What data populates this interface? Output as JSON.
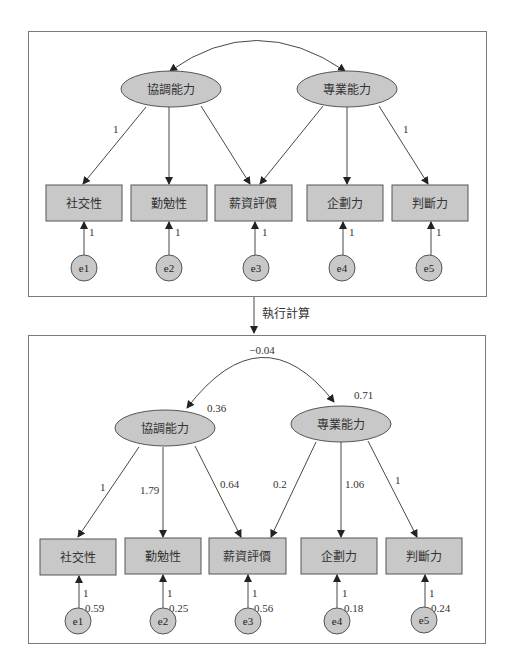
{
  "colors": {
    "node_fill": "#c8c8c8",
    "node_stroke": "#555555",
    "panel_stroke": "#7a7a7a",
    "line": "#333333"
  },
  "step_label": "執行計算",
  "top": {
    "latents": [
      {
        "id": "F1",
        "label": "協調能力"
      },
      {
        "id": "F2",
        "label": "專業能力"
      }
    ],
    "observed": [
      "社交性",
      "勤勉性",
      "薪資評價",
      "企劃力",
      "判斷力"
    ],
    "errors": [
      "e1",
      "e2",
      "e3",
      "e4",
      "e5"
    ],
    "loading_labels": {
      "F1_社交性": "1",
      "F2_判斷力": "1"
    },
    "error_paths": [
      "1",
      "1",
      "1",
      "1",
      "1"
    ]
  },
  "bottom": {
    "latents": [
      {
        "id": "F1",
        "label": "協調能力",
        "variance": "0.36"
      },
      {
        "id": "F2",
        "label": "專業能力",
        "variance": "0.71"
      }
    ],
    "covariance": "−0.04",
    "observed": [
      "社交性",
      "勤勉性",
      "薪資評價",
      "企劃力",
      "判斷力"
    ],
    "loadings": {
      "F1_社交性": "1",
      "F1_勤勉性": "1.79",
      "F1_薪資評價": "0.64",
      "F2_薪資評價": "0.2",
      "F2_企劃力": "1.06",
      "F2_判斷力": "1"
    },
    "errors": [
      {
        "label": "e1",
        "path": "1",
        "variance": "0.59"
      },
      {
        "label": "e2",
        "path": "1",
        "variance": "0.25"
      },
      {
        "label": "e3",
        "path": "1",
        "variance": "0.56"
      },
      {
        "label": "e4",
        "path": "1",
        "variance": "0.18"
      },
      {
        "label": "e5",
        "path": "1",
        "variance": "0.24"
      }
    ]
  }
}
